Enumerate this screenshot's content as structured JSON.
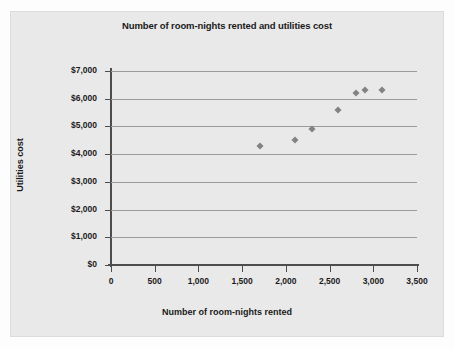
{
  "chart_data": {
    "type": "scatter",
    "title": "Number of room-nights rented and utilities cost",
    "xlabel": "Number of room-nights rented",
    "ylabel": "Utilities cost",
    "xlim": [
      0,
      3500
    ],
    "ylim": [
      0,
      7000
    ],
    "grid": true,
    "legend": "none",
    "marker": "diamond",
    "marker_color": "#828282",
    "xticks": [
      0,
      500,
      1000,
      1500,
      2000,
      2500,
      3000,
      3500
    ],
    "xtick_labels": [
      "0",
      "500",
      "1,000",
      "1,500",
      "2,000",
      "2,500",
      "3,000",
      "3,500"
    ],
    "yticks": [
      0,
      1000,
      2000,
      3000,
      4000,
      5000,
      6000,
      7000
    ],
    "ytick_labels": [
      "$0",
      "$1,000",
      "$2,000",
      "$3,000",
      "$4,000",
      "$5,000",
      "$6,000",
      "$7,000"
    ],
    "series": [
      {
        "name": "Room-nights vs utilities cost",
        "points": [
          {
            "x": 1700,
            "y": 4300
          },
          {
            "x": 2100,
            "y": 4500
          },
          {
            "x": 2300,
            "y": 4900
          },
          {
            "x": 2600,
            "y": 5600
          },
          {
            "x": 2800,
            "y": 6200
          },
          {
            "x": 2900,
            "y": 6300
          },
          {
            "x": 3100,
            "y": 6300
          }
        ]
      }
    ]
  },
  "colors": {
    "figure_background": "#fdfdfd",
    "panel_background": "#e9e9e9",
    "gridline": "#9a9a9a",
    "axis": "#4d4d4d",
    "text": "#1a1a1a",
    "marker": "#828282"
  }
}
